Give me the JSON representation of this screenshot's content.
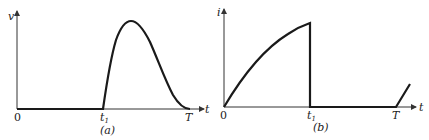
{
  "figures": [
    {
      "id": "a",
      "caption": "(a)",
      "y_label": "v",
      "x_label": "t",
      "origin_label": "0",
      "tick_labels": [
        {
          "text": "t",
          "sub": "1"
        },
        {
          "text": "T",
          "sub": ""
        }
      ],
      "description": "Voltage zero from 0 to t1, then a single pulse rising to a peak and decaying back to zero at T"
    },
    {
      "id": "b",
      "caption": "(b)",
      "y_label": "i",
      "x_label": "t",
      "origin_label": "0",
      "tick_labels": [
        {
          "text": "t",
          "sub": "1"
        },
        {
          "text": "T",
          "sub": ""
        }
      ],
      "description": "Current rises along a concave curve from 0 to t1, drops abruptly to zero, stays zero until T, then rises again"
    }
  ],
  "colors": {
    "curve": "#1a1a1a",
    "axis": "#333333",
    "background": "#ffffff"
  }
}
